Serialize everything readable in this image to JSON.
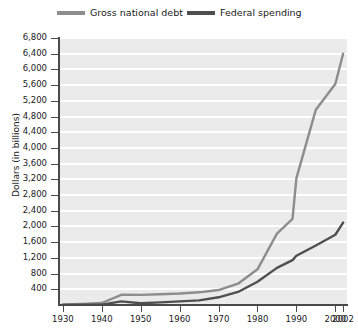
{
  "legend": {
    "position": "top",
    "items": [
      {
        "label": "Gross national debt",
        "color": "#8d8d8d",
        "swatch": "line-swatch"
      },
      {
        "label": "Federal spending",
        "color": "#4f4f4f",
        "swatch": "line-swatch"
      }
    ]
  },
  "axes": {
    "y_title": "Dollars (in billions)",
    "y_ticks": [
      "6,800",
      "6,400",
      "6,000",
      "5,600",
      "5,200",
      "4,800",
      "4,400",
      "4,000",
      "3,600",
      "3,200",
      "2,800",
      "2,400",
      "2,000",
      "1,600",
      "1,200",
      "800",
      "400"
    ],
    "y_values": [
      6800,
      6400,
      6000,
      5600,
      5200,
      4800,
      4400,
      4000,
      3600,
      3200,
      2800,
      2400,
      2000,
      1600,
      1200,
      800,
      400
    ],
    "y_min": 0,
    "y_max": 6800,
    "x_ticks": [
      "1930",
      "1940",
      "1950",
      "1960",
      "1970",
      "1980",
      "1990",
      "2000",
      "2002"
    ],
    "x_values": [
      1930,
      1940,
      1950,
      1960,
      1970,
      1980,
      1990,
      2000,
      2002
    ],
    "x_min": 1929,
    "x_max": 2003
  },
  "chart_data": {
    "type": "line",
    "title": "",
    "subtitle": "",
    "xlabel": "",
    "ylabel": "Dollars (in billions)",
    "xlim": [
      1929,
      2003
    ],
    "ylim": [
      0,
      6800
    ],
    "grid": "horizontal",
    "legend_position": "top",
    "x": [
      1930,
      1935,
      1940,
      1945,
      1950,
      1955,
      1960,
      1965,
      1970,
      1975,
      1980,
      1985,
      1989,
      1990,
      1995,
      2000,
      2002
    ],
    "series": [
      {
        "name": "Gross national debt",
        "color": "#8d8d8d",
        "values": [
          16,
          29,
          51,
          260,
          257,
          274,
          291,
          323,
          381,
          542,
          909,
          1817,
          2191,
          3233,
          4974,
          5629,
          6400
        ]
      },
      {
        "name": "Federal spending",
        "color": "#4f4f4f",
        "values": [
          3,
          7,
          9,
          93,
          43,
          68,
          92,
          118,
          196,
          332,
          591,
          946,
          1144,
          1253,
          1516,
          1789,
          2100
        ]
      }
    ]
  }
}
